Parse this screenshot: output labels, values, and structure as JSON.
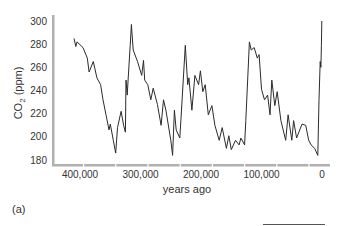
{
  "chart_data": {
    "type": "line",
    "title": "",
    "xlabel": "years ago",
    "ylabel": "CO2 (ppm)",
    "ylabel_subscript": "2",
    "x_reversed": true,
    "xlim": [
      410000,
      0
    ],
    "ylim": [
      180,
      300
    ],
    "grid": false,
    "legend": null,
    "x_ticks": [
      400000,
      300000,
      200000,
      100000,
      0
    ],
    "x_tick_labels": [
      "400,000",
      "300,000",
      "200,000",
      "100,000",
      "0"
    ],
    "y_ticks": [
      180,
      200,
      220,
      240,
      260,
      280,
      300
    ],
    "y_tick_labels": [
      "180",
      "200",
      "220",
      "240",
      "260",
      "280",
      "300"
    ],
    "series": [
      {
        "name": "CO2",
        "color": "#2b2b2b",
        "x": [
          410000,
          407000,
          405000,
          395000,
          388000,
          385000,
          378000,
          372000,
          366000,
          362000,
          357000,
          352000,
          350000,
          345000,
          341000,
          338000,
          332000,
          328000,
          325000,
          324000,
          322000,
          317000,
          315000,
          312000,
          305000,
          298000,
          295000,
          293000,
          288000,
          283000,
          279000,
          272000,
          266000,
          262000,
          258000,
          250000,
          247000,
          244000,
          241000,
          235000,
          233000,
          226000,
          222000,
          220000,
          215000,
          210000,
          204000,
          201000,
          197000,
          193000,
          188000,
          182000,
          177000,
          170000,
          165000,
          158000,
          154000,
          150000,
          143000,
          137000,
          134000,
          128000,
          126000,
          120000,
          117000,
          112000,
          107000,
          104000,
          100000,
          95000,
          90000,
          86000,
          83000,
          78000,
          74000,
          68000,
          60000,
          56000,
          50000,
          47000,
          42000,
          33000,
          27000,
          22000,
          18000,
          12000,
          7000,
          5000,
          3000,
          1800,
          1000,
          300
        ],
        "y": [
          285,
          278,
          282,
          277,
          268,
          256,
          265,
          251,
          245,
          232,
          219,
          206,
          211,
          197,
          186,
          208,
          222,
          210,
          204,
          249,
          236,
          279,
          297,
          275,
          265,
          253,
          266,
          249,
          245,
          232,
          242,
          228,
          210,
          232,
          223,
          197,
          184,
          223,
          206,
          199,
          216,
          279,
          245,
          251,
          223,
          253,
          245,
          257,
          239,
          245,
          219,
          227,
          210,
          197,
          208,
          190,
          201,
          189,
          197,
          193,
          199,
          193,
          214,
          282,
          275,
          277,
          268,
          271,
          241,
          232,
          236,
          219,
          249,
          227,
          239,
          214,
          197,
          219,
          197,
          214,
          199,
          211,
          210,
          197,
          193,
          190,
          184,
          232,
          265,
          260,
          279,
          300
        ]
      }
    ],
    "layout": {
      "plot_left": 53,
      "plot_top": 21,
      "plot_right": 325,
      "plot_bottom": 165,
      "x_pixel_at_400000": 80,
      "x_pixel_at_0": 322,
      "y_pixel_at_300": 21,
      "y_pixel_at_180": 160
    }
  },
  "figure": {
    "panel_label": "(a)"
  }
}
